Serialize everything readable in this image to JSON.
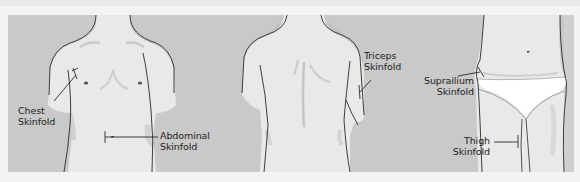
{
  "figure": {
    "colors": {
      "page_background": "#f3f3f3",
      "panel_background": "#c9c9c9",
      "skin": "#e9e9e9",
      "outline": "#2a2a2a",
      "shadow": "#b8b8b8",
      "underwear": "#ffffff",
      "label_text": "#1e1e1e"
    },
    "panels": [
      {
        "view": "front-torso",
        "labels": [
          {
            "id": "chest",
            "line1": "Chest",
            "line2": "Skinfold"
          },
          {
            "id": "abdominal",
            "line1": "Abdominal",
            "line2": "Skinfold"
          }
        ]
      },
      {
        "view": "back-torso",
        "labels": [
          {
            "id": "triceps",
            "line1": "Triceps",
            "line2": "Skinfold"
          }
        ]
      },
      {
        "view": "hips-thighs",
        "labels": [
          {
            "id": "suprailium",
            "line1": "Suprailium",
            "line2": "Skinfold"
          },
          {
            "id": "thigh",
            "line1": "Thigh",
            "line2": "Skinfold"
          }
        ]
      }
    ]
  }
}
